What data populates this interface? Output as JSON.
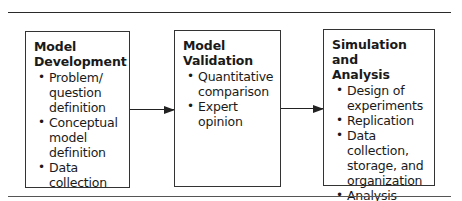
{
  "diagram": {
    "type": "process-flow",
    "boxes": [
      {
        "title": "Model Development",
        "title_lines": [
          "Model",
          "Development"
        ],
        "items": [
          {
            "label": "Problem/ question definition",
            "lines": [
              "Problem/",
              "question",
              "definition"
            ]
          },
          {
            "label": "Conceptual model definition",
            "lines": [
              "Conceptual",
              "model",
              "definition"
            ]
          },
          {
            "label": "Data collection",
            "lines": [
              "Data",
              "collection"
            ]
          }
        ]
      },
      {
        "title": "Model Validation",
        "title_lines": [
          "Model",
          "Validation"
        ],
        "items": [
          {
            "label": "Quantitative comparison",
            "lines": [
              "Quantitative",
              "comparison"
            ]
          },
          {
            "label": "Expert opinion",
            "lines": [
              "Expert",
              "opinion"
            ]
          }
        ]
      },
      {
        "title": "Simulation and Analysis",
        "title_lines": [
          "Simulation and",
          "Analysis"
        ],
        "items": [
          {
            "label": "Design of experiments",
            "lines": [
              "Design of",
              "experiments"
            ]
          },
          {
            "label": "Replication",
            "lines": [
              "Replication"
            ]
          },
          {
            "label": "Data collection, storage, and organization",
            "lines": [
              "Data",
              "collection,",
              "storage, and",
              "organization"
            ]
          },
          {
            "label": "Analysis",
            "lines": [
              "Analysis"
            ]
          }
        ]
      }
    ],
    "edges": [
      {
        "from": "Model Development",
        "to": "Model Validation"
      },
      {
        "from": "Model Validation",
        "to": "Simulation and Analysis"
      }
    ],
    "bullet_glyph": "•"
  }
}
